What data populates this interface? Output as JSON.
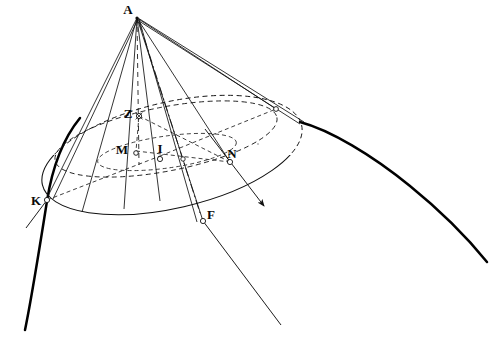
{
  "figure": {
    "background_color": "#ffffff",
    "line_color": "#101010",
    "heavy_curve_color": "#000000",
    "marker_fill": "#ffffff"
  },
  "points": [
    {
      "id": "A",
      "label": "A",
      "x": 137,
      "y": 18,
      "label_x": 130,
      "label_y": 14,
      "role": "cone-apex",
      "marker": "none"
    },
    {
      "id": "Z",
      "label": "Z",
      "x": 139,
      "y": 116,
      "label_x": 128,
      "label_y": 113,
      "role": "axis-section-point",
      "marker": "star"
    },
    {
      "id": "M",
      "label": "M",
      "x": 136,
      "y": 151,
      "label_x": 122,
      "label_y": 150,
      "role": "section-left-vertex",
      "marker": "circle"
    },
    {
      "id": "I",
      "label": "I",
      "x": 160,
      "y": 156,
      "label_x": 158,
      "label_y": 150,
      "role": "section-center",
      "marker": "circle"
    },
    {
      "id": "N",
      "label": "N",
      "x": 230,
      "y": 162,
      "label_x": 228,
      "label_y": 157,
      "role": "section-right-vertex",
      "marker": "circle"
    },
    {
      "id": "K",
      "label": "K",
      "x": 47,
      "y": 200,
      "label_x": 33,
      "label_y": 202,
      "role": "base-rim-left",
      "marker": "circle"
    },
    {
      "id": "F",
      "label": "F",
      "x": 203,
      "y": 221,
      "label_x": 207,
      "label_y": 217,
      "role": "external-focus",
      "marker": "circle"
    },
    {
      "id": "P",
      "label": "",
      "x": 276,
      "y": 109,
      "label_x": 0,
      "label_y": 0,
      "role": "hidden-rim-point",
      "marker": "circle"
    },
    {
      "id": "Q",
      "label": "",
      "x": 183,
      "y": 159,
      "label_x": 0,
      "label_y": 0,
      "role": "section-chord-point",
      "marker": "circle"
    }
  ],
  "labels_list": [
    "A",
    "Z",
    "M",
    "I",
    "N",
    "K",
    "F"
  ],
  "arrows": [
    {
      "id": "arrow-n",
      "from_x": 230,
      "from_y": 162,
      "to_x": 264,
      "to_y": 206,
      "name": "section-plane-normal-arrow"
    }
  ],
  "curves": {
    "base_ellipse": {
      "name": "cone-base-ellipse",
      "cx": 172,
      "cy": 155,
      "rx": 133,
      "ry": 53,
      "rotation": -13,
      "style": "front-solid-back-dashed"
    },
    "section_ellipse": {
      "name": "cutting-plane-ellipse",
      "cx": 166,
      "cy": 139,
      "rx": 113,
      "ry": 32,
      "rotation": -11,
      "style": "dashed"
    },
    "inner_chord_ellipse": {
      "name": "inner-section-chord-ellipse",
      "cx": 167,
      "cy": 152,
      "rx": 70,
      "ry": 16,
      "rotation": -8,
      "style": "dashed"
    },
    "hyperbola_left": {
      "name": "conic-branch-left",
      "style": "heavy-solid"
    },
    "hyperbola_right": {
      "name": "conic-branch-right",
      "style": "heavy-solid"
    }
  },
  "generators": {
    "name": "cone-generator-lines",
    "count": 10,
    "description": "straight lines from apex A to points around the base rim"
  },
  "axis": {
    "name": "cone-axis",
    "style": "dashed",
    "from": "A",
    "through": "Z"
  }
}
